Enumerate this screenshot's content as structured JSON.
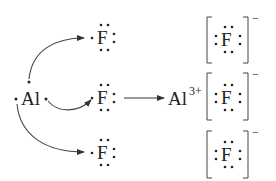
{
  "diagram": {
    "reactant_metal": {
      "symbol": "Al",
      "valence_electrons": 3
    },
    "reactant_nonmetals": [
      {
        "symbol": "F",
        "valence_electrons": 7
      },
      {
        "symbol": "F",
        "valence_electrons": 7
      },
      {
        "symbol": "F",
        "valence_electrons": 7
      }
    ],
    "reaction_arrow": "→",
    "product_cation": {
      "symbol": "Al",
      "charge": "3+"
    },
    "product_anions": [
      {
        "symbol": "F",
        "charge": "−",
        "valence_electrons": 8
      },
      {
        "symbol": "F",
        "charge": "−",
        "valence_electrons": 8
      },
      {
        "symbol": "F",
        "charge": "−",
        "valence_electrons": 8
      }
    ],
    "colors": {
      "ink": "#222222",
      "arrow": "#444444",
      "background": "#ffffff"
    }
  }
}
